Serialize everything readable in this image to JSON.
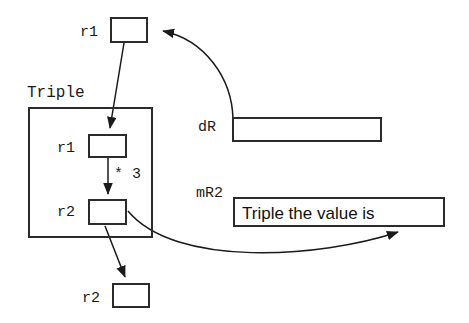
{
  "diagram": {
    "title_label": "Triple",
    "nodes": {
      "top_r1_label": "r1",
      "top_r1_value": "",
      "inner_r1_label": "r1",
      "inner_r1_value": "",
      "inner_r2_label": "r2",
      "inner_r2_value": "",
      "bottom_r2_label": "r2",
      "bottom_r2_value": "",
      "dr_label": "dR",
      "dr_value": "",
      "mr2_label": "mR2",
      "mr2_value": "Triple the value is"
    },
    "annotations": {
      "multiply_by_three": "* 3"
    },
    "colors": {
      "stroke": "#2b2b2b",
      "text": "#1a1a1a",
      "background": "#ffffff"
    }
  }
}
